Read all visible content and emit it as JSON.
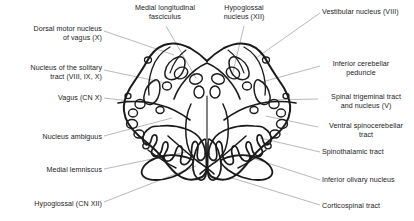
{
  "figure": {
    "style": "black and white line drawing",
    "ink_color": "#1a1a1a",
    "leader_color": "#9a9a9a",
    "background": "#ffffff"
  },
  "labels": [
    {
      "id": "dorsal-motor-nucleus-of-vagus",
      "text": "Dorsal motor nucleus\nof vagus (X)",
      "align": "right",
      "x": 6,
      "y": 25,
      "width": 96,
      "leader": "M104,31 L174,55"
    },
    {
      "id": "medial-longitudinal-fasciculus",
      "text": "Medial longitudinal\nfasciculus",
      "align": "center",
      "x": 124,
      "y": 4,
      "width": 82,
      "leader": "M166,26 L196,78"
    },
    {
      "id": "hypoglossal-nucleus",
      "text": "Hypoglossal\nnucleus (XII)",
      "align": "center",
      "x": 212,
      "y": 4,
      "width": 64,
      "leader": "M244,26 L232,76"
    },
    {
      "id": "vestibular-nucleus",
      "text": "Vestibular nucleus (VIII)",
      "align": "left",
      "x": 322,
      "y": 8,
      "width": 90,
      "leader": "M320,13 L256,58"
    },
    {
      "id": "nucleus-of-the-solitary-tract",
      "text": "Nucleus of the solitary\ntract (VIII, IX, X)",
      "align": "right",
      "x": 4,
      "y": 64,
      "width": 98,
      "leader": "M104,70 L166,83"
    },
    {
      "id": "inferior-cerebellar-peduncle",
      "text": "Inferior cerebellar\npeduncle",
      "align": "center",
      "x": 322,
      "y": 60,
      "width": 78,
      "leader": "M320,66 L262,82"
    },
    {
      "id": "vagus-nerve",
      "text": "Vagus (CN X)",
      "align": "right",
      "x": 42,
      "y": 94,
      "width": 60,
      "leader": "M104,98 L156,104"
    },
    {
      "id": "spinal-trigeminal-tract-and-nucleus",
      "text": "Spinal trigeminal tract\nand nucleus (V)",
      "align": "center",
      "x": 320,
      "y": 93,
      "width": 92,
      "leader": "M318,99 L268,100"
    },
    {
      "id": "ventral-spinocerebellar-tract",
      "text": "Ventral spinocerebellar\ntract",
      "align": "center",
      "x": 320,
      "y": 122,
      "width": 92,
      "leader": "M318,127 L266,116"
    },
    {
      "id": "nucleus-ambiguus",
      "text": "Nucleus ambiguus",
      "align": "right",
      "x": 18,
      "y": 133,
      "width": 84,
      "leader": "M104,136 L172,118"
    },
    {
      "id": "spinothalamic-tract",
      "text": "Spinothalamic tract",
      "align": "left",
      "x": 322,
      "y": 148,
      "width": 90,
      "leader": "M320,152 L260,138"
    },
    {
      "id": "medial-lemniscus",
      "text": "Medial lemniscus",
      "align": "right",
      "x": 20,
      "y": 166,
      "width": 82,
      "leader": "M104,169 L186,152"
    },
    {
      "id": "inferior-olivary-nucleus",
      "text": "Inferior olivary nucleus",
      "align": "left",
      "x": 322,
      "y": 176,
      "width": 92,
      "leader": "M320,180 L246,156"
    },
    {
      "id": "hypoglossal-nerve",
      "text": "Hypoglossal (CN XII)",
      "align": "right",
      "x": 8,
      "y": 200,
      "width": 94,
      "leader": "M104,202 L196,166"
    },
    {
      "id": "corticospinal-tract",
      "text": "Corticospinal tract",
      "align": "left",
      "x": 322,
      "y": 202,
      "width": 90,
      "leader": "M320,205 L232,178"
    }
  ]
}
